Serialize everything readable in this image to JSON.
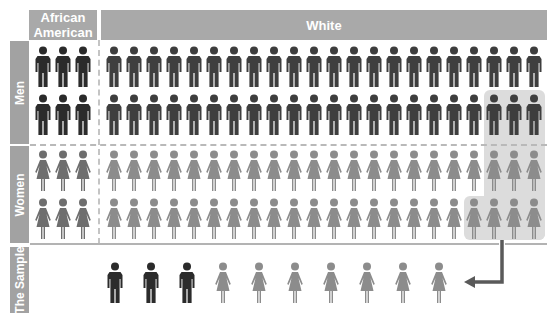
{
  "headers": {
    "african_american": "African\nAmerican",
    "african_american_line1": "African",
    "african_american_line2": "American",
    "white": "White"
  },
  "row_labels": {
    "men": "Men",
    "women": "Women",
    "sample": "The Sample"
  },
  "colors": {
    "header_bg": "#a9a9a9",
    "side_bg": "#a2a2a2",
    "aa_men": "#2b2b2b",
    "white_men": "#3e3e3e",
    "aa_women": "#6e6e6e",
    "white_women": "#8c8c8c",
    "highlight": "#dcdcdc",
    "arrow": "#5a5a5a"
  },
  "population": {
    "african_american": {
      "men_rows": 2,
      "women_rows": 2,
      "per_row": 3
    },
    "white": {
      "men_rows": 2,
      "women_rows": 2,
      "per_row": 22
    }
  },
  "highlight": {
    "description": "Selected sample region (rightmost white figures)",
    "men_row2_count": 3,
    "women_row1_count": 3,
    "women_row2_count": 4
  },
  "sample": {
    "men": 3,
    "women": 7,
    "figures": [
      "man",
      "man",
      "man",
      "woman",
      "woman",
      "woman",
      "woman",
      "woman",
      "woman",
      "woman"
    ]
  }
}
